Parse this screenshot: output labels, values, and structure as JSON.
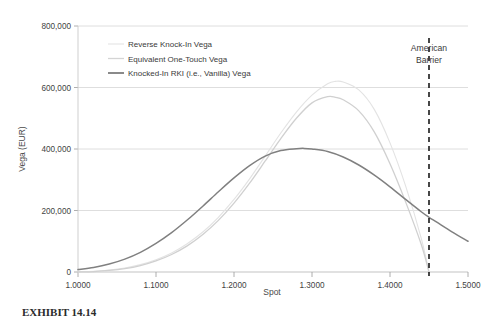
{
  "chart_data": {
    "type": "line",
    "title": "",
    "xlabel": "Spot",
    "ylabel": "Vega (EUR)",
    "xlim": [
      1.0,
      1.5
    ],
    "ylim": [
      0,
      800000
    ],
    "grid": true,
    "legend_position": "upper-left-inside",
    "xticks": [
      "1.0000",
      "1.1000",
      "1.2000",
      "1.3000",
      "1.4000",
      "1.5000"
    ],
    "xtick_values": [
      1.0,
      1.1,
      1.2,
      1.3,
      1.4,
      1.5
    ],
    "yticks": [
      "0",
      "200,000",
      "400,000",
      "600,000",
      "800,000"
    ],
    "ytick_values": [
      0,
      200000,
      400000,
      600000,
      800000
    ],
    "annotations": [
      {
        "name": "american-barrier",
        "label_line1": "American",
        "label_line2": "Barrier",
        "x": 1.45,
        "style": "dashed-vertical",
        "color": "#1a1a1a"
      }
    ],
    "series": [
      {
        "name": "Reverse Knock-In Vega",
        "color": "#e3e3e3",
        "width": 1.1,
        "x": [
          1.0,
          1.02,
          1.04,
          1.06,
          1.08,
          1.1,
          1.12,
          1.14,
          1.16,
          1.18,
          1.2,
          1.22,
          1.24,
          1.26,
          1.28,
          1.3,
          1.32,
          1.33,
          1.34,
          1.36,
          1.38,
          1.4,
          1.42,
          1.44,
          1.45
        ],
        "values": [
          0,
          2000,
          6000,
          13000,
          24000,
          40000,
          62000,
          92000,
          130000,
          178000,
          236000,
          303000,
          377000,
          452000,
          520000,
          575000,
          612000,
          620000,
          618000,
          592000,
          528000,
          420000,
          280000,
          110000,
          0
        ]
      },
      {
        "name": "Equivalent One-Touch Vega",
        "color": "#d0d0d0",
        "width": 1.3,
        "x": [
          1.0,
          1.02,
          1.04,
          1.06,
          1.08,
          1.1,
          1.12,
          1.14,
          1.16,
          1.18,
          1.2,
          1.22,
          1.24,
          1.26,
          1.28,
          1.3,
          1.32,
          1.33,
          1.34,
          1.36,
          1.38,
          1.4,
          1.42,
          1.44,
          1.45
        ],
        "values": [
          0,
          1500,
          5000,
          11000,
          21000,
          36000,
          57000,
          85000,
          122000,
          168000,
          224000,
          289000,
          361000,
          434000,
          500000,
          550000,
          570000,
          568000,
          560000,
          524000,
          455000,
          352000,
          228000,
          90000,
          0
        ]
      },
      {
        "name": "Knocked-In RKI (i.e., Vanilla) Vega",
        "color": "#808080",
        "width": 1.5,
        "x": [
          1.0,
          1.02,
          1.04,
          1.06,
          1.08,
          1.1,
          1.12,
          1.14,
          1.16,
          1.18,
          1.2,
          1.22,
          1.24,
          1.26,
          1.28,
          1.29,
          1.3,
          1.32,
          1.34,
          1.36,
          1.38,
          1.4,
          1.42,
          1.44,
          1.45,
          1.46,
          1.48,
          1.5
        ],
        "values": [
          8000,
          15000,
          26000,
          42000,
          64000,
          93000,
          128000,
          169000,
          214000,
          261000,
          306000,
          346000,
          377000,
          395000,
          401000,
          402000,
          400000,
          392000,
          374000,
          348000,
          315000,
          277000,
          236000,
          196000,
          178000,
          162000,
          130000,
          100000
        ]
      }
    ]
  },
  "legend": {
    "items": [
      {
        "label": "Reverse Knock-In Vega",
        "color": "#e8e8e8"
      },
      {
        "label": "Equivalent One-Touch Vega",
        "color": "#d4d4d4"
      },
      {
        "label": "Knocked-In RKI (i.e., Vanilla) Vega",
        "color": "#7d7d7d"
      }
    ]
  },
  "caption": {
    "text": "EXHIBIT 14.14"
  }
}
